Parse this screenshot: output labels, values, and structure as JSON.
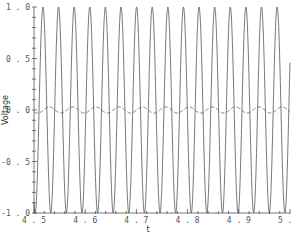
{
  "chart_data": {
    "type": "line",
    "title": "",
    "xlabel": "t",
    "ylabel": "Voltage",
    "xlim": [
      4.5,
      5.0
    ],
    "ylim": [
      -1.0,
      1.0
    ],
    "grid": false,
    "legend": null,
    "x_ticks": [
      "4.5",
      "4.6",
      "4.7",
      "4.8",
      "4.9",
      "5.0"
    ],
    "x_tick_values": [
      4.5,
      4.6,
      4.7,
      4.8,
      4.9,
      5.0
    ],
    "x_minor_step": 0.02,
    "y_ticks": [
      "1.0",
      "0.5",
      "0.0",
      "-0.5",
      "-1.0"
    ],
    "y_tick_values": [
      1.0,
      0.5,
      0.0,
      -0.5,
      -1.0
    ],
    "y_minor_step": 0.1,
    "series": [
      {
        "name": "signal",
        "style": "solid",
        "color": "#555555",
        "description": "Sinusoid amplitude 1.0, ~16 cycles over t=4.5..5.0 (~32.8 Hz)",
        "amplitude": 1.0,
        "frequency": 32.8,
        "phase_peak_t": 4.5175
      },
      {
        "name": "response",
        "style": "dashed",
        "color": "#555555",
        "description": "Small sinusoid around 0, amplitude ~0.03, ~11 cycles over t=4.5..5.0 (~22 Hz)",
        "amplitude": 0.03,
        "frequency": 22.0,
        "phase_peak_t": 4.53
      }
    ]
  }
}
